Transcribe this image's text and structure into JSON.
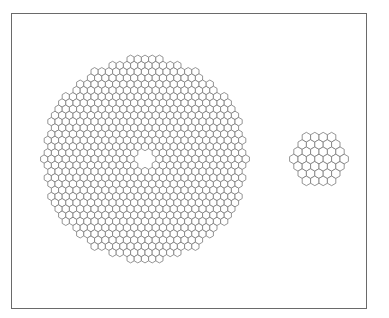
{
  "diagram": {
    "frame": {
      "x": 11,
      "y": 13,
      "width": 356,
      "height": 296,
      "stroke": "#6a6a6a"
    },
    "hex_stroke": "#7a7a7a",
    "arrays": [
      {
        "name": "large-segmented-array",
        "shape": "circular",
        "center": [
          145,
          159
        ],
        "outer_radius": 104,
        "central_hole_radius": 12,
        "segment_pitch": 7.2,
        "orientation": "pointy-top"
      },
      {
        "name": "small-segmented-array",
        "shape": "hexagonal",
        "center": [
          319,
          159
        ],
        "rings": 3,
        "segment_count": 37,
        "segment_pitch": 8.4,
        "orientation": "pointy-top"
      }
    ]
  }
}
